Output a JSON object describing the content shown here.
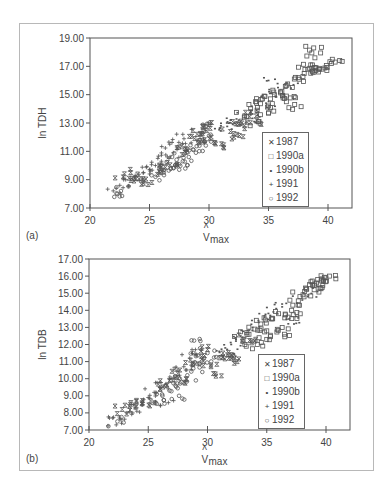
{
  "figure": {
    "panels": [
      {
        "id": "a",
        "label": "(a)",
        "ylabel": "ln  TDH",
        "xlabel_main": "V",
        "xlabel_hat": "^",
        "xlabel_sub": "max",
        "xticks": [
          "20",
          "25",
          "30",
          "35",
          "40"
        ],
        "yticks": [
          "7.00",
          "9.00",
          "11.00",
          "13.00",
          "15.00",
          "17.00",
          "19.00"
        ]
      },
      {
        "id": "b",
        "label": "(b)",
        "ylabel": "ln  TDB",
        "xlabel_main": "V",
        "xlabel_hat": "^",
        "xlabel_sub": "max",
        "xticks": [
          "20",
          "25",
          "30",
          "35",
          "40"
        ],
        "yticks": [
          "7.00",
          "8.00",
          "9.00",
          "10.00",
          "11.00",
          "12.00",
          "13.00",
          "14.00",
          "15.00",
          "16.00",
          "17.00"
        ]
      }
    ],
    "legend": [
      {
        "symbol": "x",
        "glyph": "✕",
        "label": "1987"
      },
      {
        "symbol": "square",
        "glyph": "□",
        "label": "1990a"
      },
      {
        "symbol": "dot",
        "glyph": "•",
        "label": "1990b"
      },
      {
        "symbol": "plus",
        "glyph": "+",
        "label": "1991"
      },
      {
        "symbol": "circle",
        "glyph": "○",
        "label": "1992"
      }
    ],
    "marker_color": "#555555"
  },
  "chart_data": [
    {
      "type": "scatter",
      "title": "(a)",
      "xlabel": "V̂max",
      "ylabel": "ln TDH",
      "xlim": [
        20,
        42
      ],
      "ylim": [
        7,
        19
      ],
      "xticks": [
        20,
        25,
        30,
        35,
        40
      ],
      "yticks": [
        7,
        9,
        11,
        13,
        15,
        17,
        19
      ],
      "grid": false,
      "legend_position": "lower right (inside)",
      "trend": {
        "x": [
          22,
          25,
          30,
          35,
          40.5
        ],
        "y": [
          8.2,
          10.0,
          12.7,
          15.0,
          17.3
        ]
      },
      "series": [
        {
          "name": "1987",
          "symbol": "x",
          "points": [
            [
              22.8,
              9.2
            ],
            [
              23.5,
              9.1
            ],
            [
              24.5,
              8.9
            ],
            [
              25.2,
              8.8
            ],
            [
              25.8,
              9.6
            ],
            [
              26.5,
              10.2
            ],
            [
              27.5,
              11.3
            ],
            [
              28.2,
              11.0
            ],
            [
              28.8,
              11.9
            ],
            [
              29.5,
              12.4
            ],
            [
              30.0,
              12.9
            ],
            [
              30.5,
              11.6
            ],
            [
              31.2,
              11.3
            ],
            [
              31.8,
              12.4
            ],
            [
              32.5,
              12.9
            ],
            [
              33.0,
              12.6
            ],
            [
              33.5,
              13.8
            ],
            [
              34.0,
              13.2
            ],
            [
              24.0,
              9.4
            ],
            [
              26.0,
              9.9
            ],
            [
              29.0,
              12.2
            ],
            [
              30.2,
              12.0
            ],
            [
              32.1,
              12.0
            ]
          ]
        },
        {
          "name": "1990a",
          "symbol": "square",
          "points": [
            [
              33.0,
              13.5
            ],
            [
              33.5,
              14.0
            ],
            [
              34.0,
              14.4
            ],
            [
              34.5,
              14.7
            ],
            [
              35.0,
              14.2
            ],
            [
              35.5,
              15.0
            ],
            [
              36.0,
              15.2
            ],
            [
              36.5,
              14.9
            ],
            [
              37.0,
              15.5
            ],
            [
              37.5,
              16.2
            ],
            [
              38.0,
              16.5
            ],
            [
              38.3,
              16.8
            ],
            [
              38.7,
              17.1
            ],
            [
              38.9,
              17.6
            ],
            [
              39.0,
              16.9
            ],
            [
              39.2,
              16.6
            ],
            [
              39.5,
              16.8
            ],
            [
              40.3,
              17.2
            ],
            [
              40.6,
              17.3
            ],
            [
              38.8,
              18.3
            ],
            [
              35.0,
              13.7
            ],
            [
              34.2,
              13.1
            ],
            [
              36.5,
              14.5
            ],
            [
              37.2,
              14.3
            ]
          ]
        },
        {
          "name": "1990b",
          "symbol": "dot",
          "points": [
            [
              30.5,
              12.6
            ],
            [
              31.0,
              12.8
            ],
            [
              31.5,
              13.0
            ],
            [
              32.0,
              12.9
            ],
            [
              32.5,
              13.2
            ],
            [
              33.0,
              13.4
            ],
            [
              33.5,
              13.6
            ],
            [
              34.0,
              13.9
            ],
            [
              34.8,
              14.4
            ],
            [
              35.2,
              15.1
            ],
            [
              35.8,
              15.5
            ],
            [
              36.3,
              15.0
            ],
            [
              35.0,
              16.0
            ],
            [
              31.8,
              13.2
            ],
            [
              33.8,
              13.1
            ],
            [
              37.1,
              15.7
            ]
          ]
        },
        {
          "name": "1991",
          "symbol": "plus",
          "points": [
            [
              22.2,
              8.4
            ],
            [
              22.5,
              8.6
            ],
            [
              23.0,
              9.0
            ],
            [
              23.8,
              9.3
            ],
            [
              24.5,
              9.5
            ],
            [
              25.0,
              9.7
            ],
            [
              25.5,
              10.0
            ],
            [
              26.0,
              10.3
            ],
            [
              26.5,
              10.6
            ],
            [
              27.0,
              10.9
            ],
            [
              27.3,
              11.3
            ],
            [
              27.8,
              12.2
            ],
            [
              28.5,
              11.6
            ],
            [
              29.0,
              11.8
            ],
            [
              26.7,
              11.5
            ],
            [
              25.7,
              10.5
            ]
          ]
        },
        {
          "name": "1992",
          "symbol": "circle",
          "points": [
            [
              22.3,
              8.0
            ],
            [
              22.6,
              8.2
            ],
            [
              25.5,
              9.2
            ],
            [
              26.2,
              9.5
            ],
            [
              26.8,
              9.8
            ],
            [
              27.3,
              10.1
            ],
            [
              27.8,
              10.3
            ],
            [
              28.3,
              10.6
            ],
            [
              28.7,
              11.1
            ],
            [
              29.2,
              11.4
            ],
            [
              29.6,
              11.7
            ],
            [
              30.0,
              12.1
            ],
            [
              29.8,
              12.8
            ],
            [
              28.9,
              10.9
            ],
            [
              27.5,
              9.7
            ],
            [
              26.9,
              10.6
            ]
          ]
        }
      ]
    },
    {
      "type": "scatter",
      "title": "(b)",
      "xlabel": "V̂max",
      "ylabel": "ln TDB",
      "xlim": [
        20,
        42
      ],
      "ylim": [
        7,
        17
      ],
      "xticks": [
        20,
        25,
        30,
        35,
        40
      ],
      "yticks": [
        7,
        8,
        9,
        10,
        11,
        12,
        13,
        14,
        15,
        16,
        17
      ],
      "grid": false,
      "legend_position": "lower right (inside)",
      "trend": {
        "x": [
          22,
          25,
          30,
          35,
          40
        ],
        "y": [
          7.4,
          8.9,
          11.2,
          13.5,
          15.8
        ]
      },
      "series": [
        {
          "name": "1987",
          "symbol": "x",
          "points": [
            [
              22.8,
              8.2
            ],
            [
              23.5,
              8.5
            ],
            [
              24.5,
              8.6
            ],
            [
              25.2,
              8.7
            ],
            [
              26.0,
              9.4
            ],
            [
              26.8,
              9.9
            ],
            [
              27.5,
              10.3
            ],
            [
              28.2,
              10.0
            ],
            [
              28.8,
              10.9
            ],
            [
              29.5,
              11.3
            ],
            [
              30.0,
              11.7
            ],
            [
              30.3,
              10.7
            ],
            [
              30.5,
              10.3
            ],
            [
              31.3,
              11.5
            ],
            [
              31.8,
              11.2
            ],
            [
              32.0,
              11.2
            ],
            [
              32.5,
              11.0
            ],
            [
              33.0,
              12.3
            ],
            [
              34.0,
              12.2
            ],
            [
              24.0,
              8.4
            ]
          ]
        },
        {
          "name": "1990a",
          "symbol": "square",
          "points": [
            [
              33.0,
              12.2
            ],
            [
              33.5,
              12.6
            ],
            [
              34.0,
              12.9
            ],
            [
              34.5,
              13.2
            ],
            [
              35.0,
              12.8
            ],
            [
              35.5,
              13.5
            ],
            [
              36.0,
              13.8
            ],
            [
              36.3,
              13.0
            ],
            [
              36.8,
              13.6
            ],
            [
              37.2,
              14.3
            ],
            [
              37.8,
              14.8
            ],
            [
              38.2,
              15.1
            ],
            [
              38.6,
              15.5
            ],
            [
              39.0,
              15.2
            ],
            [
              39.2,
              15.6
            ],
            [
              39.5,
              15.3
            ],
            [
              40.0,
              15.9
            ],
            [
              40.3,
              16.0
            ],
            [
              39.3,
              15.8
            ],
            [
              35.0,
              12.3
            ],
            [
              34.2,
              12.0
            ],
            [
              36.5,
              12.6
            ],
            [
              37.1,
              14.0
            ]
          ]
        },
        {
          "name": "1990b",
          "symbol": "dot",
          "points": [
            [
              31.0,
              11.6
            ],
            [
              31.5,
              11.8
            ],
            [
              32.0,
              12.0
            ],
            [
              32.4,
              12.2
            ],
            [
              32.8,
              12.5
            ],
            [
              33.3,
              12.7
            ],
            [
              33.8,
              13.0
            ],
            [
              34.3,
              13.4
            ],
            [
              34.8,
              13.6
            ],
            [
              35.3,
              13.7
            ],
            [
              35.8,
              14.1
            ],
            [
              36.3,
              14.2
            ],
            [
              36.9,
              13.5
            ],
            [
              37.3,
              13.2
            ],
            [
              38.0,
              14.6
            ],
            [
              38.5,
              14.9
            ],
            [
              38.9,
              15.3
            ],
            [
              31.8,
              11.3
            ]
          ]
        },
        {
          "name": "1991",
          "symbol": "plus",
          "points": [
            [
              22.0,
              7.7
            ],
            [
              22.3,
              7.3
            ],
            [
              22.7,
              7.6
            ],
            [
              23.2,
              8.0
            ],
            [
              23.9,
              8.3
            ],
            [
              24.5,
              8.6
            ],
            [
              25.0,
              8.9
            ],
            [
              25.5,
              9.2
            ],
            [
              26.0,
              9.5
            ],
            [
              26.5,
              9.7
            ],
            [
              27.0,
              10.0
            ],
            [
              27.5,
              10.5
            ],
            [
              28.0,
              10.7
            ],
            [
              28.5,
              11.2
            ],
            [
              29.0,
              11.4
            ],
            [
              26.7,
              8.6
            ]
          ]
        },
        {
          "name": "1992",
          "symbol": "circle",
          "points": [
            [
              22.4,
              7.5
            ],
            [
              25.6,
              8.6
            ],
            [
              26.2,
              9.0
            ],
            [
              26.8,
              9.3
            ],
            [
              27.3,
              9.6
            ],
            [
              27.8,
              9.8
            ],
            [
              28.3,
              10.2
            ],
            [
              28.8,
              10.6
            ],
            [
              29.3,
              10.9
            ],
            [
              29.7,
              11.2
            ],
            [
              30.0,
              11.5
            ],
            [
              29.4,
              12.2
            ],
            [
              28.8,
              11.5
            ],
            [
              27.6,
              9.0
            ],
            [
              26.9,
              9.9
            ]
          ]
        }
      ]
    }
  ]
}
